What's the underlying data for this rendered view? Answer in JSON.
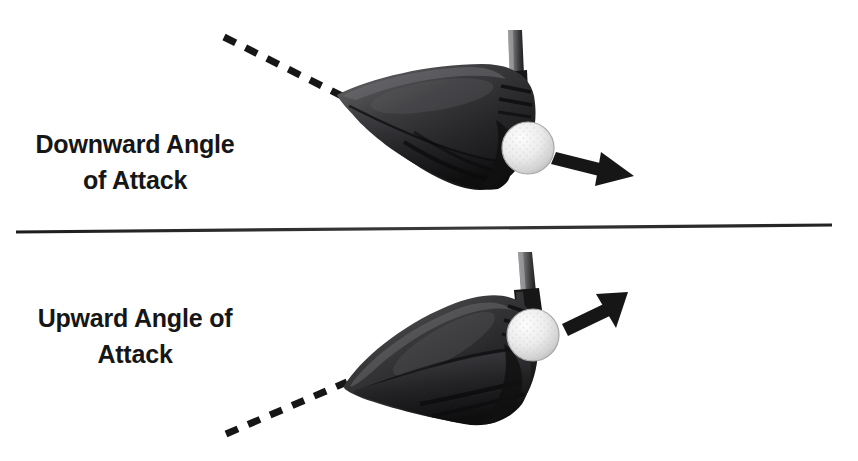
{
  "figure": {
    "background_color": "#ffffff",
    "ink_color": "#161616"
  },
  "panels": [
    {
      "id": "downward",
      "label": "Downward Angle\nof Attack",
      "label_line1": "Downward Angle",
      "label_line2": "of Attack",
      "swing_path": {
        "style": "dashed",
        "direction": "descending",
        "description": "dashed line descending from upper left to club head"
      },
      "arrow": {
        "direction": "right-and-down",
        "description": "ball launch arrow pointing right and slightly downward",
        "color": "#161616"
      },
      "club": {
        "type": "driver",
        "color": "#2a2a2a",
        "face_direction": "right"
      },
      "ball": {
        "type": "golf-ball",
        "color": "#e8e8e8"
      }
    },
    {
      "id": "upward",
      "label": "Upward Angle of\nAttack",
      "label_line1": "Upward Angle of",
      "label_line2": "Attack",
      "swing_path": {
        "style": "dashed",
        "direction": "ascending",
        "description": "dashed line ascending from lower left to club head"
      },
      "arrow": {
        "direction": "right-and-up",
        "description": "ball launch arrow pointing right and upward",
        "color": "#161616"
      },
      "club": {
        "type": "driver",
        "color": "#2a2a2a",
        "face_direction": "right"
      },
      "ball": {
        "type": "golf-ball",
        "color": "#e8e8e8"
      }
    }
  ],
  "divider": {
    "name": "horizontal-rule",
    "color": "#2b2b2b"
  }
}
